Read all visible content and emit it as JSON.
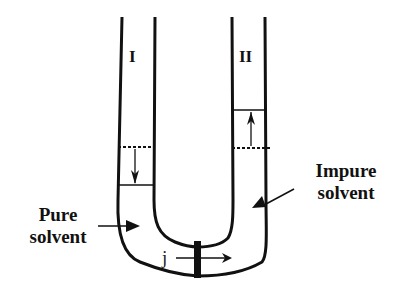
{
  "diagram": {
    "type": "U-tube osmosis",
    "tube_labels": {
      "left": "I",
      "right": "II"
    },
    "side_labels": {
      "left": {
        "line1": "Pure",
        "line2": "solvent"
      },
      "right": {
        "line1": "Impure",
        "line2": "solvent"
      }
    },
    "flux_label": "j",
    "level_changes": {
      "left": "down",
      "right": "up"
    },
    "colors": {
      "stroke": "#111111",
      "background": "#ffffff"
    }
  }
}
